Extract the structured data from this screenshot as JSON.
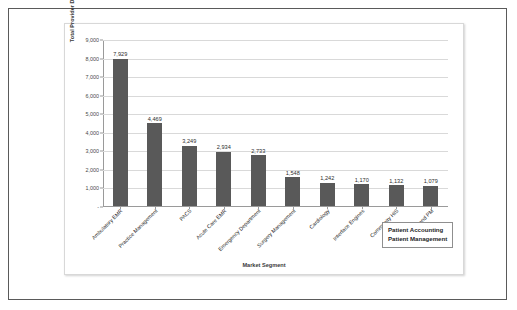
{
  "chart_data": {
    "type": "bar",
    "title": "",
    "xlabel": "Market Segment",
    "ylabel": "Total Provider Downloads",
    "ylim": [
      0,
      9000
    ],
    "ytick_step": 1000,
    "grid": true,
    "legend": "none",
    "bar_color": "#595959",
    "categories": [
      "Ambulatory EMR",
      "Practice Management",
      "PACS",
      "Acute Care EMR",
      "Emergency Department",
      "Surgery Management",
      "Cardiology",
      "Interface Engines",
      "Community HIS",
      "PA and PM"
    ],
    "values": [
      7929,
      4469,
      3249,
      2934,
      2733,
      1548,
      1242,
      1170,
      1132,
      1079
    ],
    "value_labels": [
      "7,929",
      "4,469",
      "3,249",
      "2,934",
      "2,733",
      "1,548",
      "1,242",
      "1,170",
      "1,132",
      "1,079"
    ],
    "ytick_labels": [
      "-",
      "1,000",
      "2,000",
      "3,000",
      "4,000",
      "5,000",
      "6,000",
      "7,000",
      "8,000",
      "9,000"
    ],
    "annotations": [
      {
        "line1": "Patient Accounting",
        "line2": "Patient Management"
      }
    ]
  }
}
